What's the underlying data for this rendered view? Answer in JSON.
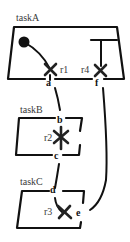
{
  "diagram": {
    "tasks": [
      {
        "id": "taskA",
        "label": "taskA"
      },
      {
        "id": "taskB",
        "label": "taskB"
      },
      {
        "id": "taskC",
        "label": "taskC"
      }
    ],
    "resources": [
      {
        "id": "r1",
        "label": "r1",
        "task": "taskA",
        "marker": "x"
      },
      {
        "id": "r4",
        "label": "r4",
        "task": "taskA",
        "marker": "x"
      },
      {
        "id": "r2",
        "label": "r2",
        "task": "taskB",
        "marker": "asterisk"
      },
      {
        "id": "r3",
        "label": "r3",
        "task": "taskC",
        "marker": "x"
      }
    ],
    "ports": [
      {
        "id": "a",
        "label": "a"
      },
      {
        "id": "f",
        "label": "f"
      },
      {
        "id": "b",
        "label": "b"
      },
      {
        "id": "c",
        "label": "c"
      },
      {
        "id": "d",
        "label": "d"
      },
      {
        "id": "e",
        "label": "e"
      }
    ],
    "connections": [
      {
        "from": "a",
        "to": "b"
      },
      {
        "from": "c",
        "to": "d"
      },
      {
        "from": "f",
        "to": "e"
      }
    ],
    "symbols": {
      "start": "filled-circle",
      "terminal": "t-bar"
    },
    "colors": {
      "ink": "#111111",
      "label": "#3a3a3a",
      "background": "#ffffff"
    }
  }
}
